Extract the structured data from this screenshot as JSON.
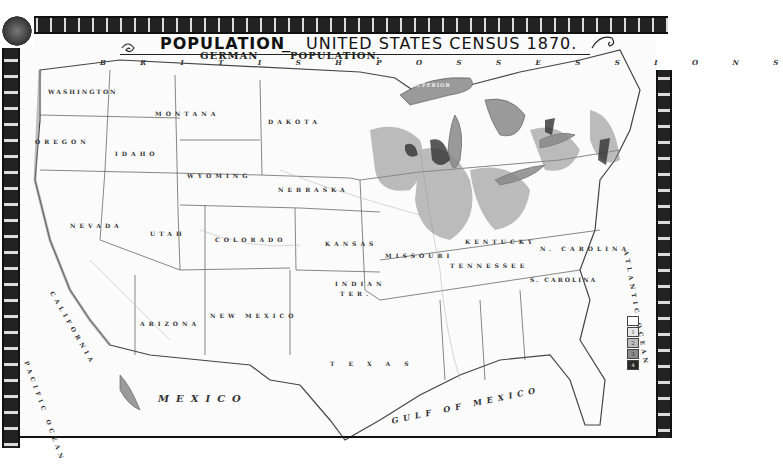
{
  "title": {
    "main": "POPULATION",
    "dash": "_",
    "sub": "UNITED STATES CENSUS 1870.",
    "subtitle_left": "GERMAN",
    "subtitle_right": "POPULATION."
  },
  "regions": {
    "british_possessions": "B R I T I S H   P O S S E S S I O N S",
    "washington": "WASHINGTON",
    "oregon": "OREGON",
    "idaho": "IDAHO",
    "montana": "MONTANA",
    "dakota": "DAKOTA",
    "wyoming": "WYOMING",
    "nebraska": "NEBRASKA",
    "nevada": "NEVADA",
    "utah": "UTAH",
    "colorado": "COLORADO",
    "kansas": "KANSAS",
    "california": "CALIFORNIA",
    "arizona": "ARIZONA",
    "new_mexico": "NEW MEXICO",
    "indian_ter_1": "INDIAN",
    "indian_ter_2": "TER.",
    "texas": "TEXAS",
    "missouri": "MISSOURI",
    "kentucky": "KENTUCKY",
    "tennessee": "TENNESSEE",
    "n_carolina": "N. CAROLINA",
    "s_carolina": "S. CAROLINA",
    "mexico": "MEXICO",
    "gulf_of_mexico": "GULF   OF   MEXICO",
    "pacific_ocean": "PACIFIC OCEAN",
    "atlantic_ocean": "ATLANTIC OCEAN",
    "superior": "SUPERIOR",
    "michigan_lake": "MICHIGAN",
    "huron": "HURON"
  },
  "legend": {
    "bins": [
      "",
      "1",
      "2",
      "3",
      "4"
    ],
    "colors": [
      "#ffffff",
      "#e6e6e6",
      "#bdbdbd",
      "#8a8a8a",
      "#2a2a2a"
    ]
  },
  "colors": {
    "ink": "#222222",
    "paper": "#fbfbfb",
    "water": "#9a9a9a"
  }
}
